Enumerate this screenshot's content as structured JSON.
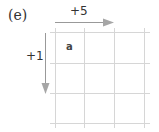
{
  "figure": {
    "panel_label": "(e)",
    "horizontal_step_label": "+5",
    "vertical_step_label": "+1",
    "cell_label": "a"
  },
  "grid": {
    "columns": 3,
    "rows": 3,
    "line_color": "#d4d4d4"
  },
  "arrows": {
    "color": "#999999"
  }
}
